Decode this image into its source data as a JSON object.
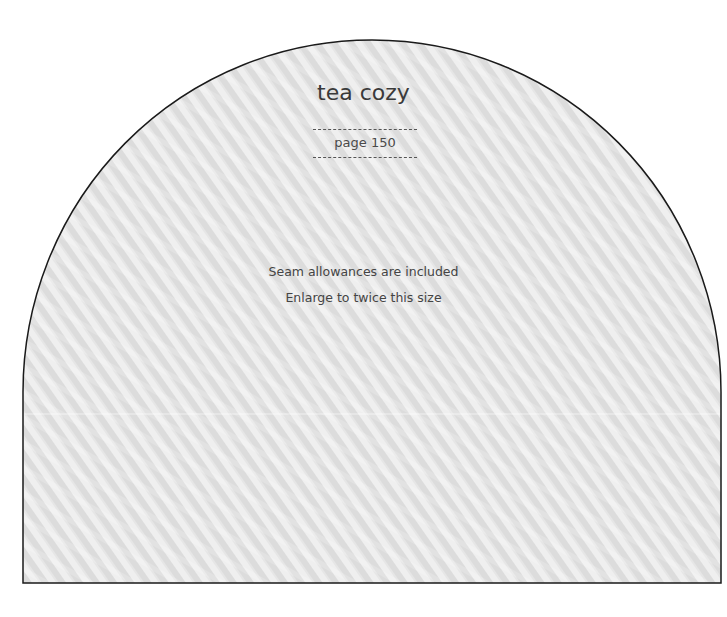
{
  "pattern": {
    "title": "tea cozy",
    "page_reference": "page 150",
    "notes": [
      "Seam allowances are included",
      "Enlarge to twice this size"
    ]
  },
  "colors": {
    "outline": "#1a1a1a",
    "fill_base": "#dedede",
    "fill_stripe": "#f2f2f2",
    "text": "#3a3a3a",
    "background": "#ffffff"
  }
}
